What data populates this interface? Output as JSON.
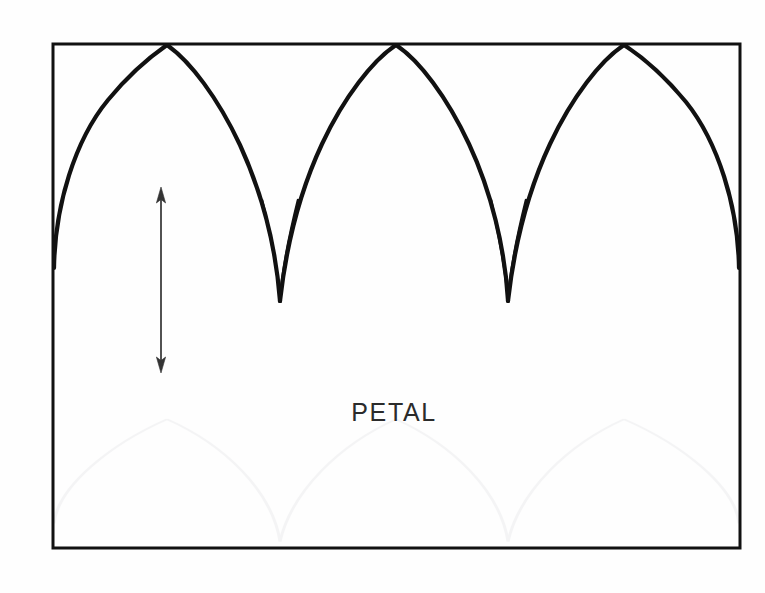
{
  "figure": {
    "kind": "technical-line-diagram",
    "caption_label": "PETAL",
    "background_color": "#fefefe",
    "ink_color": "#111111",
    "frame": {
      "name": "outer-rectangle",
      "x": 53,
      "y": 44,
      "width": 687,
      "height": 504,
      "stroke_width": 3,
      "stroke_color": "#111111"
    },
    "arches": {
      "count": 3,
      "description": "three pointed gothic petal arches spanning the frame width",
      "peak_y": 45,
      "valley_y": 301,
      "base_merge_y": 248,
      "peaks_x": [
        167,
        396,
        624
      ],
      "valleys_x": [
        280,
        508
      ],
      "left_base_x": 54,
      "right_base_x": 739,
      "stroke_color": "#111111"
    },
    "dimension_arrow": {
      "name": "height-dimension-arrow",
      "orientation": "vertical",
      "double_headed": true,
      "x": 161,
      "y_top": 188,
      "y_bottom": 372,
      "length_px": 184,
      "stroke_width": 1.6,
      "stroke_color": "#333333"
    },
    "label": {
      "text": "PETAL",
      "x": 394,
      "y": 421,
      "font_size_px": 25,
      "letter_spacing_px": 1.6,
      "color": "#2b2b2b",
      "anchor": "middle"
    },
    "ghost_bleed": {
      "present": true,
      "description": "very faint mirrored arch pattern showing through from reverse of page",
      "opacity": 0.05,
      "y_offset": 415
    }
  }
}
